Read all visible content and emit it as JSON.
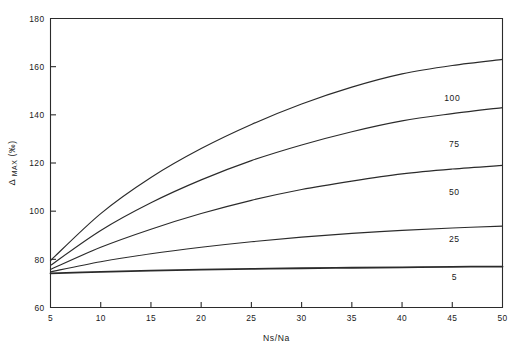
{
  "chart_data": {
    "type": "line",
    "title": "",
    "xlabel": "Ns/Na",
    "ylabel": "Δ MAX (‰)",
    "ylabel_parts": {
      "symbol": "Δ",
      "subscript": "MAX",
      "unit": "(‰)"
    },
    "xlim": [
      5,
      50
    ],
    "ylim": [
      60,
      180
    ],
    "xticks": [
      5,
      10,
      15,
      20,
      25,
      30,
      35,
      40,
      45,
      50
    ],
    "xticklabels": [
      "5",
      "10",
      "15",
      "20",
      "25",
      "30",
      "35",
      "40",
      "45",
      "50"
    ],
    "yticks": [
      60,
      80,
      100,
      120,
      140,
      160,
      180
    ],
    "yticklabels": [
      "60",
      "80",
      "100",
      "120",
      "140",
      "160",
      "180"
    ],
    "grid": false,
    "legend_position": "inline-right",
    "x": [
      5,
      10,
      15,
      20,
      25,
      30,
      35,
      40,
      45,
      50
    ],
    "series": [
      {
        "name": "100",
        "label": "100",
        "values": [
          79.5,
          99.0,
          114.0,
          126.0,
          136.0,
          144.5,
          151.5,
          157.0,
          160.5,
          163.0
        ]
      },
      {
        "name": "75",
        "label": "75",
        "values": [
          77.5,
          92.0,
          103.5,
          113.0,
          121.0,
          127.5,
          133.0,
          137.5,
          140.5,
          143.0
        ]
      },
      {
        "name": "50",
        "label": "50",
        "values": [
          75.8,
          85.0,
          92.5,
          99.0,
          104.5,
          109.0,
          112.5,
          115.5,
          117.5,
          119.0
        ]
      },
      {
        "name": "25",
        "label": "25",
        "values": [
          74.8,
          79.0,
          82.3,
          85.0,
          87.3,
          89.2,
          90.8,
          92.0,
          93.0,
          93.8
        ]
      },
      {
        "name": "5",
        "label": "5",
        "values": [
          74.2,
          74.8,
          75.3,
          75.7,
          76.0,
          76.3,
          76.5,
          76.7,
          76.9,
          77.0
        ]
      }
    ],
    "curve_labels": [
      {
        "text": "100",
        "x": 45.0,
        "y": 147.0
      },
      {
        "text": "75",
        "x": 45.2,
        "y": 128.0
      },
      {
        "text": "50",
        "x": 45.2,
        "y": 108.0
      },
      {
        "text": "25",
        "x": 45.2,
        "y": 88.5
      },
      {
        "text": "5",
        "x": 45.2,
        "y": 72.5
      }
    ],
    "colors": {
      "line": "#2b2b2b",
      "background": "#ffffff",
      "text": "#1a1a1a"
    }
  }
}
